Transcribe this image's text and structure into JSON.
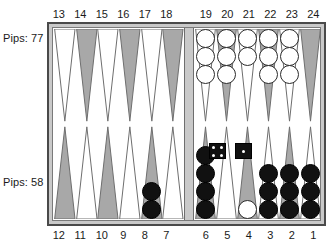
{
  "app": {
    "title": "Backgammon Board"
  },
  "labels": {
    "pips_top": "Pips: 77",
    "pips_bottom": "Pips: 58"
  },
  "point_numbers": {
    "top_left": [
      "13",
      "14",
      "15",
      "16",
      "17",
      "18"
    ],
    "top_right": [
      "19",
      "20",
      "21",
      "22",
      "23",
      "24"
    ],
    "bottom_left": [
      "12",
      "11",
      "10",
      "9",
      "8",
      "7"
    ],
    "bottom_right": [
      "6",
      "5",
      "4",
      "3",
      "2",
      "1"
    ]
  },
  "doubling_cube": {
    "value": "2"
  },
  "dice": [
    {
      "name": "die-left",
      "value": 4
    },
    {
      "name": "die-right",
      "value": 1
    }
  ],
  "colors": {
    "board_border": "#4a4a4a",
    "board_felt": "#ffffff",
    "frame_gray": "#c9c9c9",
    "point_dark": "#a8a8a8",
    "point_light": "#ffffff",
    "checker_white": "#ffffff",
    "checker_black": "#111111",
    "text": "#1a1a1a"
  },
  "board": {
    "quad_top_left": [
      {
        "point": 13,
        "shade": "light",
        "color": null,
        "count": 0
      },
      {
        "point": 14,
        "shade": "dark",
        "color": null,
        "count": 0
      },
      {
        "point": 15,
        "shade": "light",
        "color": null,
        "count": 0
      },
      {
        "point": 16,
        "shade": "dark",
        "color": null,
        "count": 0
      },
      {
        "point": 17,
        "shade": "light",
        "color": null,
        "count": 0
      },
      {
        "point": 18,
        "shade": "dark",
        "color": null,
        "count": 0
      }
    ],
    "quad_top_right": [
      {
        "point": 19,
        "shade": "light",
        "color": "white",
        "count": 3
      },
      {
        "point": 20,
        "shade": "dark",
        "color": "white",
        "count": 3
      },
      {
        "point": 21,
        "shade": "light",
        "color": "white",
        "count": 2
      },
      {
        "point": 22,
        "shade": "dark",
        "color": "white",
        "count": 3
      },
      {
        "point": 23,
        "shade": "light",
        "color": "white",
        "count": 3
      },
      {
        "point": 24,
        "shade": "dark",
        "color": null,
        "count": 0
      }
    ],
    "quad_bottom_left": [
      {
        "point": 12,
        "shade": "dark",
        "color": null,
        "count": 0
      },
      {
        "point": 11,
        "shade": "light",
        "color": null,
        "count": 0
      },
      {
        "point": 10,
        "shade": "dark",
        "color": null,
        "count": 0
      },
      {
        "point": 9,
        "shade": "light",
        "color": null,
        "count": 0
      },
      {
        "point": 8,
        "shade": "dark",
        "color": "black",
        "count": 2
      },
      {
        "point": 7,
        "shade": "light",
        "color": null,
        "count": 0
      }
    ],
    "quad_bottom_right": [
      {
        "point": 6,
        "shade": "dark",
        "color": "black",
        "count": 4
      },
      {
        "point": 5,
        "shade": "light",
        "color": null,
        "count": 0
      },
      {
        "point": 4,
        "shade": "dark",
        "color": "white",
        "count": 1
      },
      {
        "point": 3,
        "shade": "light",
        "color": "black",
        "count": 3
      },
      {
        "point": 2,
        "shade": "dark",
        "color": "black",
        "count": 3
      },
      {
        "point": 1,
        "shade": "light",
        "color": "black",
        "count": 3
      }
    ]
  }
}
